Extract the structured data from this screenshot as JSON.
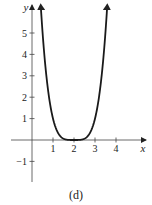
{
  "caption": "(d)",
  "chart_data": {
    "type": "line",
    "title": "",
    "xlabel": "x",
    "ylabel": "y",
    "xlim": [
      -0.5,
      5
    ],
    "ylim": [
      -2,
      6
    ],
    "x_ticks": [
      1,
      2,
      3,
      4
    ],
    "y_ticks": [
      -1,
      1,
      2,
      3,
      4,
      5
    ],
    "x_tick_labels": [
      "1",
      "2",
      "3",
      "4"
    ],
    "y_tick_labels": [
      "−1",
      "1",
      "2",
      "3",
      "4",
      "5"
    ],
    "grid": false,
    "legend": null,
    "series": [
      {
        "name": "f(x) = (x - 2)^4",
        "x": [
          0.42,
          0.6,
          0.8,
          1.0,
          1.2,
          1.4,
          1.6,
          1.8,
          2.0,
          2.2,
          2.4,
          2.6,
          2.8,
          3.0,
          3.2,
          3.4,
          3.58
        ],
        "y": [
          6.23,
          3.84,
          2.07,
          1.0,
          0.41,
          0.13,
          0.03,
          0.0,
          0.0,
          0.0,
          0.03,
          0.13,
          0.41,
          1.0,
          2.07,
          3.84,
          6.23
        ],
        "arrows_at_ends": true
      }
    ]
  }
}
